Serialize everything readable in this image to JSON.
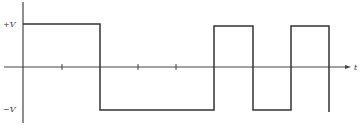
{
  "figure": {
    "type": "square-wave-timing-diagram",
    "y_labels": {
      "positive": "+V",
      "negative": "−V"
    },
    "x_label": "t",
    "colors": {
      "line": "#333333",
      "axis": "#444444",
      "background": "#ffffff"
    },
    "tick_count": 4,
    "signal": {
      "description": "Bipolar pulse waveform switching between +V and −V",
      "segments": [
        {
          "level": "+V",
          "t_start": 0,
          "t_end": 2
        },
        {
          "level": "−V",
          "t_start": 2,
          "t_end": 5
        },
        {
          "level": "+V",
          "t_start": 5,
          "t_end": 6
        },
        {
          "level": "−V",
          "t_start": 6,
          "t_end": 7
        },
        {
          "level": "+V",
          "t_start": 7,
          "t_end": 8
        }
      ]
    }
  }
}
